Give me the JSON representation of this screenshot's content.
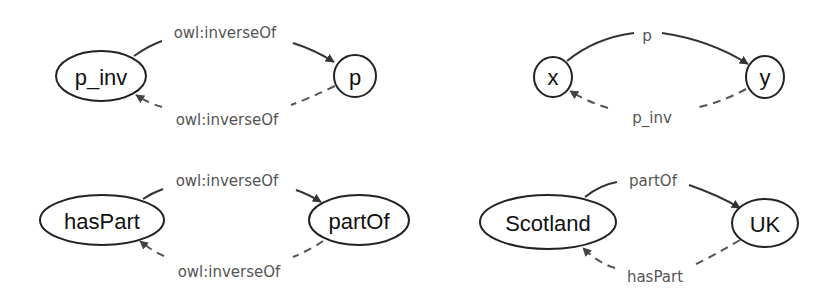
{
  "diagrams": [
    {
      "name": "inverse-definition",
      "nodes": [
        {
          "id": "p_inv",
          "label": "p_inv"
        },
        {
          "id": "p",
          "label": "p"
        }
      ],
      "edges": [
        {
          "from": "p_inv",
          "to": "p",
          "label": "owl:inverseOf",
          "style": "solid"
        },
        {
          "from": "p",
          "to": "p_inv",
          "label": "owl:inverseOf",
          "style": "dashed"
        }
      ]
    },
    {
      "name": "inverse-instance",
      "nodes": [
        {
          "id": "x",
          "label": "x"
        },
        {
          "id": "y",
          "label": "y"
        }
      ],
      "edges": [
        {
          "from": "x",
          "to": "y",
          "label": "p",
          "style": "solid"
        },
        {
          "from": "y",
          "to": "x",
          "label": "p_inv",
          "style": "dashed"
        }
      ]
    },
    {
      "name": "haspart-partof-definition",
      "nodes": [
        {
          "id": "hasPart",
          "label": "hasPart"
        },
        {
          "id": "partOf",
          "label": "partOf"
        }
      ],
      "edges": [
        {
          "from": "hasPart",
          "to": "partOf",
          "label": "owl:inverseOf",
          "style": "solid"
        },
        {
          "from": "partOf",
          "to": "hasPart",
          "label": "owl:inverseOf",
          "style": "dashed"
        }
      ]
    },
    {
      "name": "scotland-uk-instance",
      "nodes": [
        {
          "id": "Scotland",
          "label": "Scotland"
        },
        {
          "id": "UK",
          "label": "UK"
        }
      ],
      "edges": [
        {
          "from": "Scotland",
          "to": "UK",
          "label": "partOf",
          "style": "solid"
        },
        {
          "from": "UK",
          "to": "Scotland",
          "label": "hasPart",
          "style": "dashed"
        }
      ]
    }
  ],
  "colors": {
    "node_stroke": "#222222",
    "edge_solid": "#333333",
    "edge_dashed": "#555555",
    "edge_label": "#555555"
  }
}
